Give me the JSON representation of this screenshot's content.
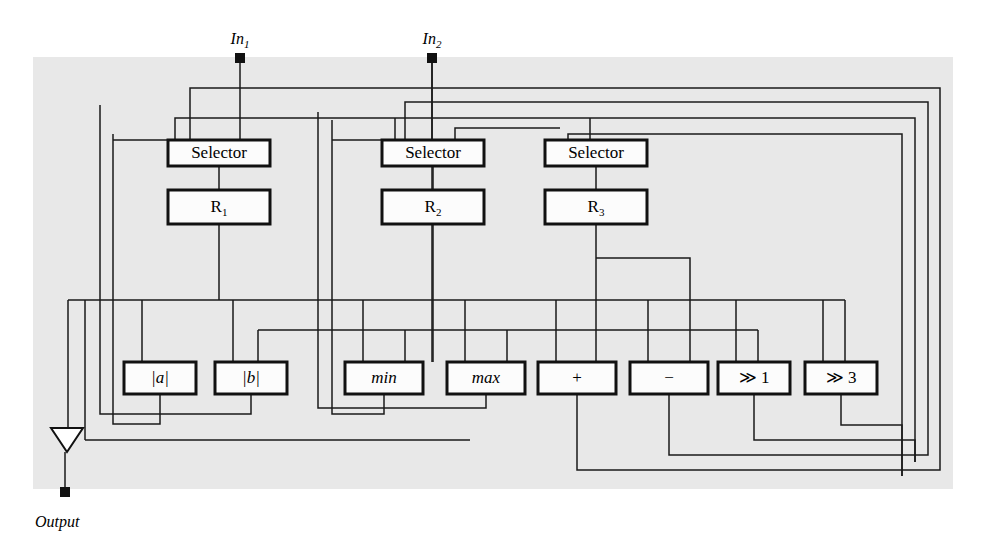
{
  "figure": {
    "type": "datapath-block-diagram",
    "panel": {
      "x": 33,
      "y": 57,
      "width": 920,
      "height": 432,
      "background_color": "#e8e8e8"
    },
    "colors": {
      "panel": "#e8e8e8",
      "wire": "#1a1a1a",
      "box_fill": "#fcfcfc",
      "box_stroke": "#111111",
      "page": "#ffffff"
    }
  },
  "ports": {
    "inputs": [
      {
        "id": "in1",
        "label": "In",
        "subscript": "1",
        "x": 240,
        "label_y": 40,
        "pad_y": 58
      },
      {
        "id": "in2",
        "label": "In",
        "subscript": "2",
        "x": 432,
        "label_y": 40,
        "pad_y": 58
      }
    ],
    "output": {
      "id": "out",
      "label": "Output",
      "x": 65,
      "triangle_y": 428,
      "pad_y": 492,
      "label_y": 523
    }
  },
  "selectors": [
    {
      "id": "sel1",
      "label": "Selector",
      "x": 168,
      "y": 140,
      "width": 102,
      "height": 26,
      "inputs": 3
    },
    {
      "id": "sel2",
      "label": "Selector",
      "x": 382,
      "y": 140,
      "width": 102,
      "height": 26,
      "inputs": 4
    },
    {
      "id": "sel3",
      "label": "Selector",
      "x": 545,
      "y": 140,
      "width": 102,
      "height": 26,
      "inputs": 2
    }
  ],
  "registers": [
    {
      "id": "r1",
      "label": "R",
      "subscript": "1",
      "x": 168,
      "y": 190,
      "width": 102,
      "height": 34
    },
    {
      "id": "r2",
      "label": "R",
      "subscript": "2",
      "x": 382,
      "y": 190,
      "width": 102,
      "height": 34
    },
    {
      "id": "r3",
      "label": "R",
      "subscript": "3",
      "x": 545,
      "y": 190,
      "width": 102,
      "height": 34
    }
  ],
  "function_units": [
    {
      "id": "fu-abs-a",
      "label": "|a|",
      "italic": true,
      "x": 124,
      "y": 362,
      "width": 72,
      "height": 32,
      "arity": 1
    },
    {
      "id": "fu-abs-b",
      "label": "|b|",
      "italic": true,
      "x": 215,
      "y": 362,
      "width": 72,
      "height": 32,
      "arity": 1
    },
    {
      "id": "fu-min",
      "label": "min",
      "italic": true,
      "x": 345,
      "y": 362,
      "width": 78,
      "height": 32,
      "arity": 2
    },
    {
      "id": "fu-max",
      "label": "max",
      "italic": true,
      "x": 447,
      "y": 362,
      "width": 78,
      "height": 32,
      "arity": 2
    },
    {
      "id": "fu-add",
      "label": "+",
      "italic": false,
      "x": 538,
      "y": 362,
      "width": 78,
      "height": 32,
      "arity": 2
    },
    {
      "id": "fu-sub",
      "label": "−",
      "italic": false,
      "x": 630,
      "y": 362,
      "width": 78,
      "height": 32,
      "arity": 2
    },
    {
      "id": "fu-shr1",
      "label": "≫ 1",
      "italic": false,
      "x": 718,
      "y": 362,
      "width": 72,
      "height": 32,
      "arity": 1
    },
    {
      "id": "fu-shr3",
      "label": "≫ 3",
      "italic": false,
      "x": 805,
      "y": 362,
      "width": 72,
      "height": 32,
      "arity": 1
    }
  ],
  "buses": {
    "top_feedback_y": [
      88,
      102,
      118,
      134
    ],
    "right_return_x": [
      940,
      928,
      915,
      902
    ],
    "bottom_feedback_y": [
      470,
      455,
      440,
      425
    ],
    "left_feedback_x": [
      85,
      100,
      113
    ],
    "mid_bus_y": 300
  }
}
